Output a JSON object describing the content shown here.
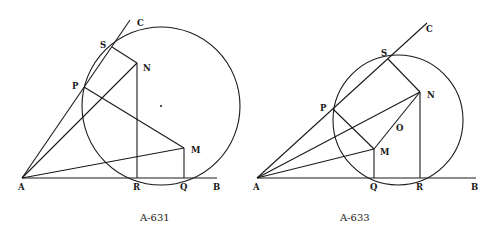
{
  "figures": [
    {
      "caption": "A-631",
      "circle": {
        "cx": 161,
        "cy": 106,
        "r": 79
      },
      "center_dot": {
        "x": 161,
        "y": 106
      },
      "points": {
        "A": {
          "x": 22,
          "y": 178,
          "label": "A",
          "lx": 18,
          "ly": 190
        },
        "B": {
          "x": 217,
          "y": 178,
          "label": "B",
          "lx": 213,
          "ly": 190
        },
        "C": {
          "x": 130,
          "y": 20,
          "label": "C",
          "lx": 137,
          "ly": 26
        },
        "S": {
          "x": 112,
          "y": 47,
          "label": "S",
          "lx": 100,
          "ly": 48
        },
        "N": {
          "x": 137,
          "y": 63,
          "label": "N",
          "lx": 143,
          "ly": 71
        },
        "P": {
          "x": 84,
          "y": 87,
          "label": "P",
          "lx": 72,
          "ly": 89
        },
        "M": {
          "x": 184,
          "y": 148,
          "label": "M",
          "lx": 191,
          "ly": 153
        },
        "R": {
          "x": 137,
          "y": 178,
          "label": "R",
          "lx": 133,
          "ly": 190
        },
        "Q": {
          "x": 184,
          "y": 178,
          "label": "Q",
          "lx": 180,
          "ly": 190
        }
      },
      "segments": [
        [
          "A",
          "C"
        ],
        [
          "A",
          "B"
        ],
        [
          "A",
          "N"
        ],
        [
          "A",
          "M"
        ],
        [
          "S",
          "N"
        ],
        [
          "N",
          "R"
        ],
        [
          "P",
          "M"
        ],
        [
          "M",
          "Q"
        ]
      ],
      "caption_pos": {
        "x": 140,
        "y": 221
      }
    },
    {
      "caption": "A-633",
      "circle": {
        "cx": 398,
        "cy": 120,
        "r": 65
      },
      "points": {
        "A": {
          "x": 257,
          "y": 178,
          "label": "A",
          "lx": 253,
          "ly": 190
        },
        "B": {
          "x": 476,
          "y": 178,
          "label": "B",
          "lx": 471,
          "ly": 190
        },
        "C": {
          "x": 427,
          "y": 23,
          "label": "C",
          "lx": 426,
          "ly": 32
        },
        "S": {
          "x": 388,
          "y": 59,
          "label": "S",
          "lx": 381,
          "ly": 56
        },
        "N": {
          "x": 420,
          "y": 92,
          "label": "N",
          "lx": 427,
          "ly": 98
        },
        "P": {
          "x": 333,
          "y": 109,
          "label": "P",
          "lx": 320,
          "ly": 111
        },
        "O": {
          "x": 0,
          "y": 0,
          "label": "O",
          "lx": 396,
          "ly": 131
        },
        "M": {
          "x": 374,
          "y": 149,
          "label": "M",
          "lx": 380,
          "ly": 155
        },
        "Q": {
          "x": 374,
          "y": 178,
          "label": "Q",
          "lx": 370,
          "ly": 190
        },
        "R": {
          "x": 420,
          "y": 178,
          "label": "R",
          "lx": 416,
          "ly": 190
        }
      },
      "segments": [
        [
          "A",
          "C"
        ],
        [
          "A",
          "B"
        ],
        [
          "A",
          "N"
        ],
        [
          "A",
          "M"
        ],
        [
          "S",
          "N"
        ],
        [
          "N",
          "R"
        ],
        [
          "P",
          "M"
        ],
        [
          "M",
          "Q"
        ],
        [
          "M",
          "N"
        ]
      ],
      "caption_pos": {
        "x": 340,
        "y": 221
      }
    }
  ]
}
